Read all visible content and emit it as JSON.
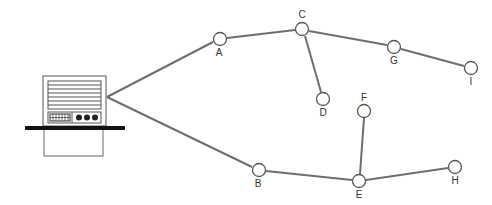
{
  "diagram": {
    "type": "network-topology",
    "root": {
      "label": "",
      "icon": "computer-icon",
      "anchor": [
        107,
        97
      ]
    },
    "nodes": [
      {
        "id": "A",
        "label": "A",
        "x": 220,
        "y": 39,
        "label_pos": "below"
      },
      {
        "id": "B",
        "label": "B",
        "x": 259,
        "y": 170,
        "label_pos": "below"
      },
      {
        "id": "C",
        "label": "C",
        "x": 302,
        "y": 29,
        "label_pos": "above"
      },
      {
        "id": "D",
        "label": "D",
        "x": 323,
        "y": 99,
        "label_pos": "below"
      },
      {
        "id": "E",
        "label": "E",
        "x": 359,
        "y": 181,
        "label_pos": "below"
      },
      {
        "id": "F",
        "label": "F",
        "x": 364,
        "y": 111,
        "label_pos": "above"
      },
      {
        "id": "G",
        "label": "G",
        "x": 394,
        "y": 47,
        "label_pos": "below"
      },
      {
        "id": "H",
        "label": "H",
        "x": 455,
        "y": 167,
        "label_pos": "below"
      },
      {
        "id": "I",
        "label": "I",
        "x": 471,
        "y": 68,
        "label_pos": "below"
      }
    ],
    "edges": [
      [
        "root",
        "A"
      ],
      [
        "root",
        "B"
      ],
      [
        "A",
        "C"
      ],
      [
        "C",
        "D"
      ],
      [
        "C",
        "G"
      ],
      [
        "G",
        "I"
      ],
      [
        "B",
        "E"
      ],
      [
        "E",
        "F"
      ],
      [
        "E",
        "H"
      ]
    ],
    "colors": {
      "edge": "#6e6e6e",
      "node_stroke": "#555555",
      "computer": "#222222"
    }
  }
}
